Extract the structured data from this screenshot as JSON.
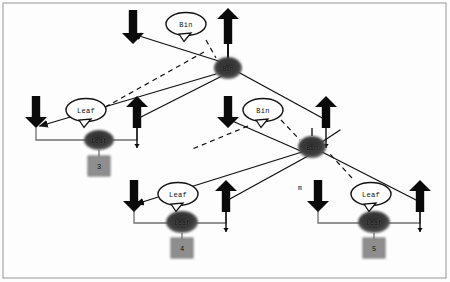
{
  "figure": {
    "kind": "tree-diagram",
    "background_color": "#fdfdfd",
    "border_color": "#9b9b9b",
    "callout_shape": "ellipse-speech-balloon",
    "callout_fill": "#ffffff",
    "callout_stroke": "#111111",
    "node_fill": "#3a3a3a",
    "node_text_color": "#0d0d0d",
    "box_fill": "#8e8e8e",
    "box_stroke": "#6f6f6f",
    "solid_edge_color": "#111111",
    "dashed_edge_color": "#111111",
    "pointer_line_color": "#6f6f6f",
    "arrow_color": "#0a0a0a"
  },
  "callouts": [
    {
      "id": "callout-bin-top",
      "label": "Bin",
      "cx": 186,
      "cy": 24
    },
    {
      "id": "callout-leaf-left",
      "label": "Leaf",
      "cx": 86,
      "cy": 110
    },
    {
      "id": "callout-bin-mid",
      "label": "Bin",
      "cx": 263,
      "cy": 110
    },
    {
      "id": "callout-leaf-mid",
      "label": "Leaf",
      "cx": 178,
      "cy": 194
    },
    {
      "id": "callout-leaf-right",
      "label": "Leaf",
      "cx": 371,
      "cy": 194
    }
  ],
  "nodes": [
    {
      "id": "node-bin-root",
      "label": "Bin",
      "cx": 228,
      "cy": 68,
      "rx": 14,
      "ry": 11
    },
    {
      "id": "node-leaf-left",
      "label": "Leaf",
      "cx": 99,
      "cy": 140,
      "rx": 15,
      "ry": 10
    },
    {
      "id": "node-bin-mid",
      "label": "Bin",
      "cx": 312,
      "cy": 147,
      "rx": 14,
      "ry": 11
    },
    {
      "id": "node-leaf-mid",
      "label": "Leaf",
      "cx": 182,
      "cy": 222,
      "rx": 16,
      "ry": 11
    },
    {
      "id": "node-leaf-right",
      "label": "Leaf",
      "cx": 374,
      "cy": 222,
      "rx": 16,
      "ry": 11
    }
  ],
  "value_boxes": [
    {
      "id": "box-leaf-left",
      "value": "3",
      "cx": 99,
      "cy": 166,
      "w": 22,
      "h": 20
    },
    {
      "id": "box-leaf-mid",
      "value": "4",
      "cx": 182,
      "cy": 248,
      "w": 22,
      "h": 20
    },
    {
      "id": "box-leaf-right",
      "value": "5",
      "cx": 374,
      "cy": 248,
      "w": 22,
      "h": 20
    }
  ],
  "edge_labels": [
    {
      "id": "edge-label-m",
      "text": "m",
      "x": 300,
      "y": 188
    }
  ],
  "big_arrows": [
    {
      "id": "arrow-down-root-left",
      "x": 133,
      "y": 10,
      "dir": "down",
      "len": 34
    },
    {
      "id": "arrow-up-root-right",
      "x": 228,
      "y": 8,
      "dir": "up",
      "len": 36,
      "tail": 22
    },
    {
      "id": "arrow-down-leaf-left",
      "x": 36,
      "y": 96,
      "dir": "down",
      "len": 32
    },
    {
      "id": "arrow-up-leaf-left",
      "x": 137,
      "y": 96,
      "dir": "up",
      "len": 32,
      "tail": 20
    },
    {
      "id": "arrow-down-bin-mid",
      "x": 228,
      "y": 96,
      "dir": "down",
      "len": 32
    },
    {
      "id": "arrow-up-bin-mid",
      "x": 326,
      "y": 96,
      "dir": "up",
      "len": 32,
      "tail": 20
    },
    {
      "id": "arrow-down-leaf-mid",
      "x": 134,
      "y": 180,
      "dir": "down",
      "len": 32
    },
    {
      "id": "arrow-up-leaf-mid",
      "x": 226,
      "y": 180,
      "dir": "up",
      "len": 32,
      "tail": 20
    },
    {
      "id": "arrow-down-leaf-right",
      "x": 318,
      "y": 180,
      "dir": "down",
      "len": 32
    },
    {
      "id": "arrow-up-leaf-right",
      "x": 420,
      "y": 180,
      "dir": "up",
      "len": 32,
      "tail": 20
    }
  ],
  "tree_edges": [
    {
      "id": "tree-edge-root-left",
      "x1": 228,
      "y1": 64,
      "x2": 133,
      "y2": 34,
      "arrow": "end"
    },
    {
      "id": "tree-edge-root-up",
      "x1": 228,
      "y1": 64,
      "x2": 228,
      "y2": 34,
      "arrow": "none"
    },
    {
      "id": "tree-edge-root-down-left",
      "x1": 216,
      "y1": 74,
      "x2": 40,
      "y2": 126,
      "arrow": "end"
    },
    {
      "id": "tree-edge-root-down-mid",
      "x1": 222,
      "y1": 76,
      "x2": 135,
      "y2": 120,
      "arrow": "none"
    },
    {
      "id": "tree-edge-root-right",
      "x1": 238,
      "y1": 72,
      "x2": 326,
      "y2": 120,
      "arrow": "none"
    },
    {
      "id": "tree-edge-mid-left",
      "x1": 303,
      "y1": 152,
      "x2": 230,
      "y2": 120,
      "arrow": "none"
    },
    {
      "id": "tree-edge-mid-down-left",
      "x1": 302,
      "y1": 152,
      "x2": 136,
      "y2": 204,
      "arrow": "end"
    },
    {
      "id": "tree-edge-mid-down-mid",
      "x1": 308,
      "y1": 156,
      "x2": 228,
      "y2": 200,
      "arrow": "none"
    },
    {
      "id": "tree-edge-mid-down-right",
      "x1": 322,
      "y1": 152,
      "x2": 420,
      "y2": 202,
      "arrow": "none"
    },
    {
      "id": "tree-edge-mid-up-right",
      "x1": 322,
      "y1": 142,
      "x2": 340,
      "y2": 130,
      "arrow": "none"
    }
  ],
  "dashed_edges": [
    {
      "id": "dashed-root-to-left",
      "x1": 204,
      "y1": 52,
      "x2": 100,
      "y2": 110
    },
    {
      "id": "dashed-root-to-node",
      "x1": 206,
      "y1": 40,
      "x2": 216,
      "y2": 58
    },
    {
      "id": "dashed-mid-to-node",
      "x1": 281,
      "y1": 120,
      "x2": 300,
      "y2": 140
    },
    {
      "id": "dashed-mid-to-left",
      "x1": 248,
      "y1": 126,
      "x2": 190,
      "y2": 150
    },
    {
      "id": "dashed-right-to-node",
      "x1": 352,
      "y1": 178,
      "x2": 330,
      "y2": 154
    }
  ]
}
